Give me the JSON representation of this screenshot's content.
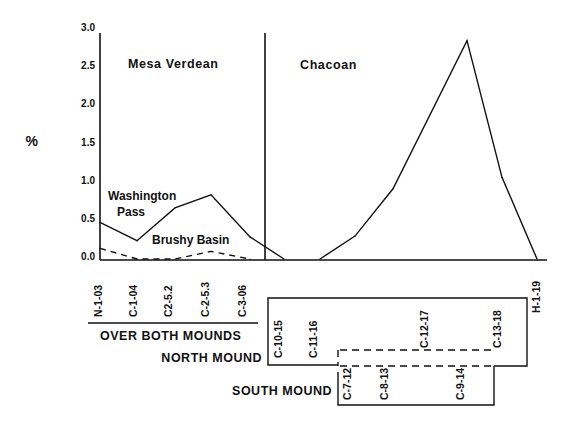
{
  "chart_data": {
    "type": "line",
    "title": "",
    "xlabel": "",
    "ylabel": "%",
    "ylim": [
      0,
      3.0
    ],
    "yticks": [
      "0.0",
      "0.5",
      "1.0",
      "1.5",
      "2.0",
      "2.5",
      "3.0"
    ],
    "grid": false,
    "periods": [
      {
        "name": "Mesa Verdean",
        "samples": [
          "N-1-03",
          "C-1-04",
          "C2-5.2",
          "C-2-5.3",
          "C-3-06"
        ]
      },
      {
        "name": "Chacoan",
        "samples": [
          "C-10-15",
          "C-11-16",
          "C-7-12",
          "C-8-13",
          "C-12-17",
          "C-9-14",
          "C-13-18",
          "H-1-19"
        ]
      }
    ],
    "x_categories": [
      "N-1-03",
      "C-1-04",
      "C2-5.2",
      "C-2-5.3",
      "C-3-06",
      "C-10-15",
      "C-11-16",
      "C-7-12",
      "C-8-13",
      "C-12-17",
      "C-9-14",
      "C-13-18",
      "H-1-19"
    ],
    "series": [
      {
        "name": "Washington Pass",
        "style": "solid",
        "label": [
          "Washington",
          "Pass"
        ],
        "points": [
          {
            "sample": "N-1-03",
            "value": 0.48
          },
          {
            "sample": "C-1-04",
            "value": 0.24
          },
          {
            "sample": "C2-5.2",
            "value": 0.67
          },
          {
            "sample": "C-2-5.3",
            "value": 0.84
          },
          {
            "sample": "C-3-06",
            "value": 0.29
          },
          {
            "sample": "C-10-15",
            "value": 0.0
          }
        ]
      },
      {
        "name": "Brushy Basin",
        "style": "dashed",
        "label": [
          "Brushy Basin"
        ],
        "points": [
          {
            "sample": "N-1-03",
            "value": 0.14
          },
          {
            "sample": "C-1-04",
            "value": 0.0
          },
          {
            "sample": "C2-5.2",
            "value": 0.0
          },
          {
            "sample": "C-2-5.3",
            "value": 0.1
          },
          {
            "sample": "C-3-06",
            "value": 0.0
          }
        ]
      },
      {
        "name": "Chacoan (Washington Pass)",
        "style": "solid",
        "label": [],
        "points": [
          {
            "sample": "C-11-16",
            "value": 0.0
          },
          {
            "sample": "C-7-12",
            "value": 0.3
          },
          {
            "sample": "C-8-13",
            "value": 0.92
          },
          {
            "sample": "C-9-14",
            "value": 2.86
          },
          {
            "sample": "C-13-18",
            "value": 1.07
          },
          {
            "sample": "H-1-19",
            "value": 0.0
          }
        ]
      }
    ],
    "groups": [
      {
        "name": "OVER BOTH MOUNDS",
        "samples": [
          "N-1-03",
          "C-1-04",
          "C2-5.2",
          "C-2-5.3",
          "C-3-06"
        ]
      },
      {
        "name": "NORTH MOUND",
        "samples": [
          "C-10-15",
          "C-11-16",
          "C-12-17",
          "C-13-18"
        ]
      },
      {
        "name": "SOUTH MOUND",
        "samples": [
          "C-7-12",
          "C-8-13",
          "C-9-14"
        ]
      }
    ],
    "ungrouped_samples": [
      "H-1-19"
    ]
  }
}
